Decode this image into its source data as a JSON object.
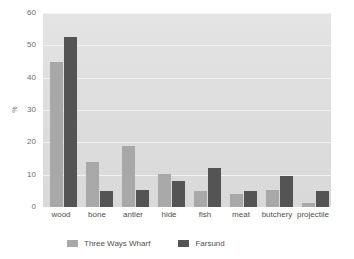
{
  "chart_data": {
    "type": "bar",
    "title": "",
    "subtitle": "",
    "xlabel": "",
    "ylabel": "%",
    "ylim": [
      0,
      60
    ],
    "yticks": [
      0,
      10,
      20,
      30,
      40,
      50,
      60
    ],
    "grid": true,
    "legend_position": "bottom",
    "categories": [
      "wood",
      "bone",
      "antler",
      "hide",
      "fish",
      "meat",
      "butchery",
      "projectile"
    ],
    "series": [
      {
        "name": "Three Ways Wharf",
        "color": "#a8a8a8",
        "values": [
          45,
          14,
          19,
          10.2,
          5,
          4,
          5.3,
          1.3
        ]
      },
      {
        "name": "Farsund",
        "color": "#545454",
        "values": [
          52.5,
          5,
          5.2,
          8,
          12,
          5,
          9.5,
          5
        ]
      }
    ]
  },
  "colors": {
    "plot_background": "#e0e0e0",
    "gridline": "#f1f1f1",
    "page_background": "#ffffff",
    "text": "#4f4f4f",
    "tick_text": "#6e6e6e"
  }
}
